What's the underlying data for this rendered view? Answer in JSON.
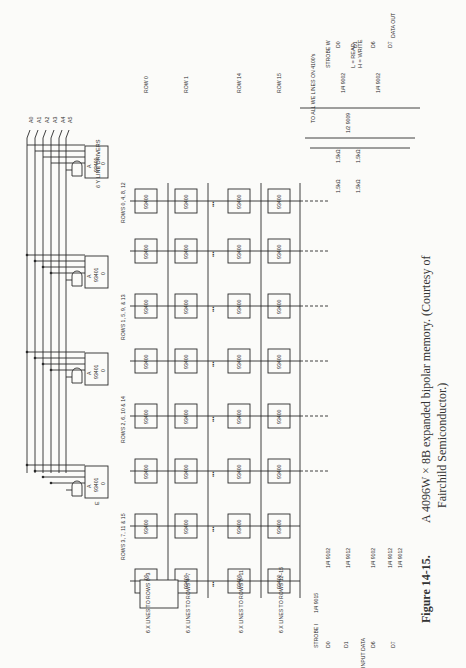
{
  "figure": {
    "number": "Figure 14-15.",
    "caption_line1": "A 4096W × 8B expanded bipolar memory. (Courtesy of",
    "caption_line2": "Fairchild Semiconductor.)"
  },
  "address_lines_y": [
    "A0",
    "A1",
    "A2",
    "A3",
    "A4",
    "A5"
  ],
  "address_lines_x": [
    "A6",
    "A7",
    "A8",
    "A9",
    "A10",
    "A11"
  ],
  "y_drivers": {
    "label": "6 Y LINE DRIVERS",
    "chip": "93401",
    "pins": {
      "a": "A",
      "e": "E",
      "o": "0"
    },
    "groups": [
      "ROWS 0, 4, 8, 12",
      "ROWS 1, 5, 9, & 13",
      "ROWS 2, 6, 10 & 14",
      "ROWS 3, 7, 11 & 15"
    ]
  },
  "x_drivers": {
    "chip": "93401",
    "groups": [
      "6 X LINES TO ROWS 0–3",
      "6 X LINES TO ROWS 4–7",
      "6 X LINES TO ROWS 8–11",
      "6 X LINES TO ROWS 12–15"
    ]
  },
  "memory": {
    "chip": "93400",
    "first_col_pins": {
      "y": "Y",
      "x": "X",
      "we": "WE 1/0"
    },
    "rows": [
      "ROW 0",
      "ROW 1",
      "ROW 14",
      "ROW 15"
    ],
    "ellipsis": "•••"
  },
  "control": {
    "rw_label_l": "L = READ",
    "rw_label_h": "H = WRITE",
    "strobe_w": "STROBE W",
    "strobe_i": "STROBE I",
    "gate_9009": "1/2 9009",
    "gate_9015": "1/4 9015",
    "we_note": "TO ALL WE LINES ON 4100's",
    "resistor": "1.5kΩ"
  },
  "data_out": {
    "label": "DATA OUT",
    "lines": [
      "D0",
      "D1",
      "D6",
      "D7"
    ],
    "gate": "1/4 9002"
  },
  "data_in": {
    "label": "INPUT DATA",
    "lines": [
      "D0",
      "D1",
      "D6",
      "D7"
    ],
    "gates": [
      "1/4 9102",
      "1/4 9012",
      "1/4 9102",
      "1/4 9012",
      "1/4 9012"
    ]
  }
}
